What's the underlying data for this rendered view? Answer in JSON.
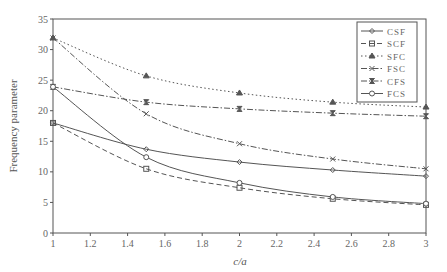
{
  "chart_data": {
    "type": "line",
    "title": "",
    "xlabel": "c/a",
    "ylabel": "Frequency parameter",
    "xlim": [
      1,
      3
    ],
    "ylim": [
      0,
      35
    ],
    "xticks": [
      "1",
      "1.2",
      "1.4",
      "1.6",
      "1.8",
      "2",
      "2.2",
      "2.4",
      "2.6",
      "2.8",
      "3"
    ],
    "yticks": [
      "0",
      "5",
      "10",
      "15",
      "20",
      "25",
      "30",
      "35"
    ],
    "grid": false,
    "legend_position": "upper right",
    "x": [
      1,
      1.5,
      2,
      2.5,
      3
    ],
    "series": [
      {
        "name": "CSF",
        "values": [
          18.0,
          13.7,
          11.6,
          10.3,
          9.3
        ],
        "line": "solid",
        "marker": "diamond"
      },
      {
        "name": "SCF",
        "values": [
          18.0,
          10.5,
          7.4,
          5.6,
          4.6
        ],
        "line": "dashed",
        "marker": "square"
      },
      {
        "name": "SFC",
        "values": [
          31.9,
          25.7,
          22.9,
          21.4,
          20.6
        ],
        "line": "dotted",
        "marker": "triangle"
      },
      {
        "name": "FSC",
        "values": [
          31.9,
          19.5,
          14.6,
          12.1,
          10.5
        ],
        "line": "dashdot",
        "marker": "x"
      },
      {
        "name": "CFS",
        "values": [
          23.9,
          21.4,
          20.3,
          19.6,
          19.1
        ],
        "line": "dashdot",
        "marker": "hourglass"
      },
      {
        "name": "FCS",
        "values": [
          23.9,
          12.4,
          8.2,
          5.9,
          4.8
        ],
        "line": "solid",
        "marker": "circle"
      }
    ]
  }
}
